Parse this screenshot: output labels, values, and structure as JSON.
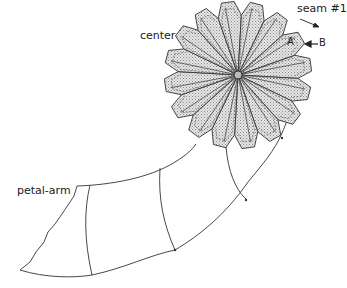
{
  "figure": {
    "type": "quilt-pattern-diagram",
    "labels": {
      "center": "center",
      "seam": "seam #1",
      "point_a": "A",
      "point_b": "B",
      "petal_arm": "petal-arm"
    },
    "rosette": {
      "center": [
        238,
        75
      ],
      "outer_radius": 76,
      "valley_radius": 60,
      "petal_count": 16,
      "rotation_deg": -8,
      "fill": "#d4d4d4",
      "stroke": "#333333"
    },
    "arm": {
      "stroke": "#333333",
      "segment_count": 4
    }
  }
}
